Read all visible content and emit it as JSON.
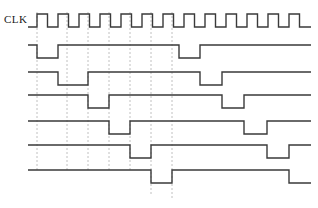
{
  "figure": {
    "type": "digital-timing-diagram",
    "title": "",
    "width": 318,
    "height": 208,
    "background_color": "#ffffff",
    "wave_color": "#3a3a3a",
    "grid_color": "#b9b9b9",
    "wave_stroke_width": 1.4,
    "grid_stroke_width": 0.9,
    "grid_dash": "2,2"
  },
  "labels": {
    "clk": "CLK"
  },
  "time_axis": {
    "x_start": 28,
    "x_end": 311,
    "clock_period": 21.0,
    "clock_first_rise": 37,
    "clock_cycles": 13
  },
  "gridlines": {
    "note": "dashed vertical reference lines at clock edges",
    "x_positions": [
      37,
      67,
      88,
      109,
      130,
      151,
      172
    ],
    "y_top": 12,
    "y_bottom_default": 170,
    "y_bottom_overrides": {
      "151": 196,
      "172": 200
    }
  },
  "chart_data": {
    "type": "line",
    "title": "",
    "xlabel": "",
    "ylabel": "",
    "signals": [
      {
        "name": "CLK",
        "row": 0,
        "y_high": 14,
        "y_low": 27,
        "kind": "clock",
        "start_level": "low",
        "description": "Free running square wave, 13 pulses across the frame"
      },
      {
        "name": "Q0",
        "row": 1,
        "y_high": 45,
        "y_low": 58,
        "kind": "data",
        "start_level": "high",
        "transitions": [
          {
            "x": 37,
            "to": "low"
          },
          {
            "x": 58,
            "to": "high"
          },
          {
            "x": 179,
            "to": "low"
          },
          {
            "x": 200,
            "to": "high"
          }
        ]
      },
      {
        "name": "Q1",
        "row": 2,
        "y_high": 72,
        "y_low": 85,
        "kind": "data",
        "start_level": "high",
        "transitions": [
          {
            "x": 58,
            "to": "low"
          },
          {
            "x": 88,
            "to": "high"
          },
          {
            "x": 200,
            "to": "low"
          },
          {
            "x": 222,
            "to": "high"
          }
        ]
      },
      {
        "name": "Q2",
        "row": 3,
        "y_high": 95,
        "y_low": 108,
        "kind": "data",
        "start_level": "high",
        "transitions": [
          {
            "x": 88,
            "to": "low"
          },
          {
            "x": 109,
            "to": "high"
          },
          {
            "x": 222,
            "to": "low"
          },
          {
            "x": 244,
            "to": "high"
          }
        ]
      },
      {
        "name": "Q3",
        "row": 4,
        "y_high": 121,
        "y_low": 134,
        "kind": "data",
        "start_level": "high",
        "transitions": [
          {
            "x": 109,
            "to": "low"
          },
          {
            "x": 130,
            "to": "high"
          },
          {
            "x": 244,
            "to": "low"
          },
          {
            "x": 267,
            "to": "high"
          }
        ]
      },
      {
        "name": "Q4",
        "row": 5,
        "y_high": 145,
        "y_low": 158,
        "kind": "data",
        "start_level": "high",
        "transitions": [
          {
            "x": 130,
            "to": "low"
          },
          {
            "x": 151,
            "to": "high"
          },
          {
            "x": 267,
            "to": "low"
          },
          {
            "x": 289,
            "to": "high"
          }
        ]
      },
      {
        "name": "Q5",
        "row": 6,
        "y_high": 170,
        "y_low": 183,
        "kind": "data",
        "start_level": "high",
        "transitions": [
          {
            "x": 151,
            "to": "low"
          },
          {
            "x": 172,
            "to": "high"
          },
          {
            "x": 289,
            "to": "low"
          }
        ]
      }
    ]
  }
}
